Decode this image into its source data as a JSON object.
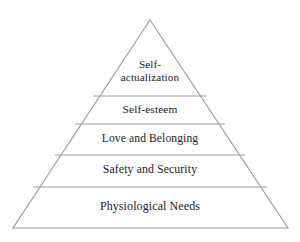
{
  "diagram": {
    "type": "pyramid",
    "background_color": "#ffffff",
    "stroke_color": "#999999",
    "text_color": "#1b1b1b",
    "apex": {
      "x": 150,
      "y": 20
    },
    "base_left": {
      "x": 13,
      "y": 228
    },
    "base_right": {
      "x": 288,
      "y": 228
    },
    "divider_y": [
      96,
      124,
      155,
      187
    ],
    "tiers": [
      {
        "index": 0,
        "label": "Self-\nactualization",
        "label_flat": "Self-actualization",
        "lines": [
          "Self-",
          "actualization"
        ]
      },
      {
        "index": 1,
        "label": "Self-esteem",
        "label_flat": "Self-esteem",
        "lines": [
          "Self-esteem"
        ]
      },
      {
        "index": 2,
        "label": "Love and Belonging",
        "label_flat": "Love and Belonging",
        "lines": [
          "Love and Belonging"
        ]
      },
      {
        "index": 3,
        "label": "Safety and Security",
        "label_flat": "Safety and Security",
        "lines": [
          "Safety and Security"
        ]
      },
      {
        "index": 4,
        "label": "Physiological Needs",
        "label_flat": "Physiological Needs",
        "lines": [
          "Physiological Needs"
        ]
      }
    ]
  }
}
